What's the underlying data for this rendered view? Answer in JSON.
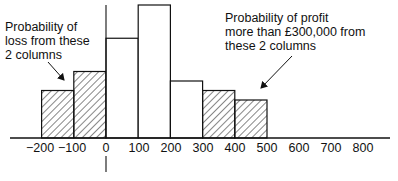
{
  "chart_data": {
    "type": "bar",
    "title": "",
    "xlabel": "",
    "ylabel": "",
    "bin_edges": [
      -200,
      -100,
      0,
      100,
      200,
      300,
      400,
      500
    ],
    "categories": [
      "-200 to -100",
      "-100 to 0",
      "0 to 100",
      "100 to 200",
      "200 to 300",
      "300 to 400",
      "400 to 500"
    ],
    "values": [
      0.1,
      0.14,
      0.21,
      0.28,
      0.12,
      0.1,
      0.08
    ],
    "shaded": [
      true,
      true,
      false,
      false,
      false,
      true,
      true
    ],
    "x_ticks": [
      "−200",
      "−100",
      "0",
      "100",
      "200",
      "300",
      "400",
      "500",
      "600",
      "700",
      "800"
    ],
    "annotations": [
      {
        "text": "Probability of loss from these 2 columns",
        "points_to": "-200 to 0"
      },
      {
        "text": "Probability of profit more than £300,000 from these 2 columns",
        "points_to": "300 to 500"
      }
    ],
    "grid": false,
    "legend": "none"
  },
  "annotations": {
    "loss": [
      "Probability of",
      "loss from these",
      "2 columns"
    ],
    "profit": [
      "Probability of profit",
      "more than £300,000 from",
      "these 2 columns"
    ]
  },
  "ticks": [
    "−200",
    "−100",
    "0",
    "100",
    "200",
    "300",
    "400",
    "500",
    "600",
    "700",
    "800"
  ]
}
